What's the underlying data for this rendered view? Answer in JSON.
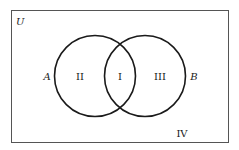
{
  "diagram": {
    "type": "venn",
    "universe_label": "U",
    "sets": [
      {
        "label": "A"
      },
      {
        "label": "B"
      }
    ],
    "regions": {
      "intersection": "I",
      "a_only": "II",
      "b_only": "III",
      "outside": "IV"
    },
    "colors": {
      "stroke": "#1a1a1a",
      "frame": "#555555",
      "background": "#ffffff"
    }
  }
}
